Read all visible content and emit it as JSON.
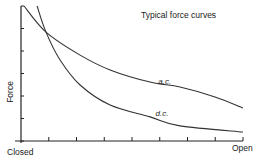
{
  "chart_data": {
    "type": "line",
    "title": "Typical force curves",
    "xlabel": "",
    "ylabel": "Force",
    "x_tick_labels": {
      "start": "Closed",
      "end": "Open"
    },
    "x_ticks": 9,
    "y_ticks": 7,
    "xlim": [
      0,
      8
    ],
    "ylim": [
      0,
      6
    ],
    "grid": false,
    "legend": "inline curve labels",
    "series": [
      {
        "name": "a.c.",
        "label_pos": [
          4.95,
          2.55
        ],
        "points": [
          [
            0.11,
            6.0
          ],
          [
            0.9,
            4.84
          ],
          [
            2.13,
            3.82
          ],
          [
            3.21,
            3.16
          ],
          [
            4.65,
            2.62
          ],
          [
            5.73,
            2.4
          ],
          [
            6.99,
            1.96
          ],
          [
            8.0,
            1.47
          ]
        ]
      },
      {
        "name": "d.c.",
        "label_pos": [
          4.85,
          1.1
        ],
        "points": [
          [
            0.58,
            6.0
          ],
          [
            0.9,
            4.84
          ],
          [
            1.41,
            3.6
          ],
          [
            2.13,
            2.49
          ],
          [
            3.21,
            1.6
          ],
          [
            4.65,
            1.07
          ],
          [
            5.73,
            0.67
          ],
          [
            8.0,
            0.4
          ]
        ]
      }
    ]
  },
  "labels": {
    "title": "Typical force curves",
    "ylabel": "Force",
    "closed": "Closed",
    "open": "Open",
    "ac": "a.c.",
    "dc": "d.c."
  },
  "colors": {
    "line": "#333333",
    "axis": "#222222",
    "text": "#1a1a1a"
  }
}
